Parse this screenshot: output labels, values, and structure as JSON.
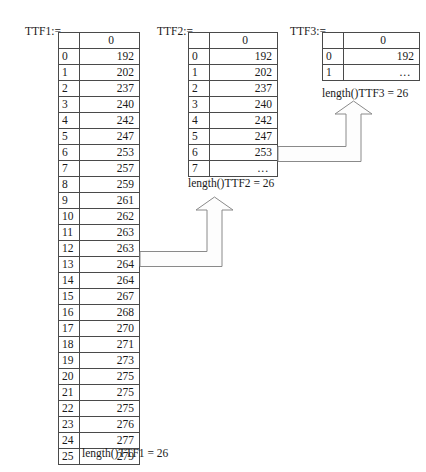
{
  "diagram": {
    "title_absent": true,
    "tables": [
      {
        "id": "ttf1",
        "label": "TTF1:=",
        "column_header": "0",
        "caption": "length()TTF1 = 26",
        "rows": [
          {
            "index": "0",
            "value": "192"
          },
          {
            "index": "1",
            "value": "202"
          },
          {
            "index": "2",
            "value": "237"
          },
          {
            "index": "3",
            "value": "240"
          },
          {
            "index": "4",
            "value": "242"
          },
          {
            "index": "5",
            "value": "247"
          },
          {
            "index": "6",
            "value": "253"
          },
          {
            "index": "7",
            "value": "257"
          },
          {
            "index": "8",
            "value": "259"
          },
          {
            "index": "9",
            "value": "261"
          },
          {
            "index": "10",
            "value": "262"
          },
          {
            "index": "11",
            "value": "263"
          },
          {
            "index": "12",
            "value": "263"
          },
          {
            "index": "13",
            "value": "264"
          },
          {
            "index": "14",
            "value": "264"
          },
          {
            "index": "15",
            "value": "267"
          },
          {
            "index": "16",
            "value": "268"
          },
          {
            "index": "17",
            "value": "270"
          },
          {
            "index": "18",
            "value": "271"
          },
          {
            "index": "19",
            "value": "273"
          },
          {
            "index": "20",
            "value": "275"
          },
          {
            "index": "21",
            "value": "275"
          },
          {
            "index": "22",
            "value": "275"
          },
          {
            "index": "23",
            "value": "276"
          },
          {
            "index": "24",
            "value": "277"
          },
          {
            "index": "25",
            "value": "279"
          }
        ]
      },
      {
        "id": "ttf2",
        "label": "TTF2:=",
        "column_header": "0",
        "caption": "length()TTF2 = 26",
        "rows": [
          {
            "index": "0",
            "value": "192"
          },
          {
            "index": "1",
            "value": "202"
          },
          {
            "index": "2",
            "value": "237"
          },
          {
            "index": "3",
            "value": "240"
          },
          {
            "index": "4",
            "value": "242"
          },
          {
            "index": "5",
            "value": "247"
          },
          {
            "index": "6",
            "value": "253"
          },
          {
            "index": "7",
            "value": "..."
          }
        ]
      },
      {
        "id": "ttf3",
        "label": "TTF3:=",
        "column_header": "0",
        "caption": "length()TTF3 = 26",
        "rows": [
          {
            "index": "0",
            "value": "192"
          },
          {
            "index": "1",
            "value": "..."
          }
        ]
      }
    ],
    "arrows": [
      {
        "id": "arrow-ttf1-to-ttf2",
        "direction": "up",
        "from": "ttf1",
        "to": "ttf2"
      },
      {
        "id": "arrow-ttf2-to-ttf3",
        "direction": "up",
        "from": "ttf2",
        "to": "ttf3"
      }
    ]
  }
}
